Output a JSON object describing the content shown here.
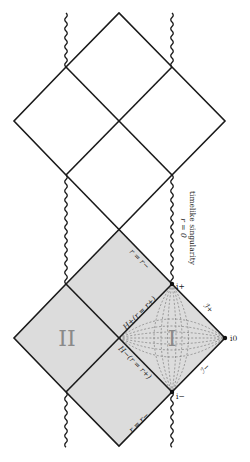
{
  "diagram": {
    "type": "Penrose diagram (Reissner-Nordström black hole)",
    "colors": {
      "line": "#1a1a1a",
      "shade": "#dcdcdc",
      "region_label": "#8a8a8a",
      "grid": "#7a7a7a"
    },
    "regions": {
      "region_one": "I",
      "region_two": "II"
    },
    "horizons": {
      "future_horizon": "H+(r = r+)",
      "past_horizon": "H−(r = r+)",
      "inner_upper": "r = r−",
      "inner_lower": "r = r−"
    },
    "infinities": {
      "future_timelike": "i+",
      "past_timelike": "i−",
      "spatial": "i0",
      "future_null": "ℐ+",
      "past_null": "ℐ−"
    },
    "singularity_annotation": {
      "line1": "timelike singularity",
      "line2": "r = 0"
    }
  }
}
